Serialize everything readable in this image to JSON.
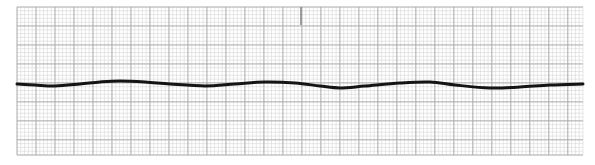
{
  "strip": {
    "paper_color": "#ffffff",
    "minor_grid_color": "#d6d6d6",
    "major_grid_color": "#a8a8a8",
    "trace_color": "#141414",
    "grid": {
      "x": 17,
      "y": 7,
      "width": 566,
      "height": 148,
      "minor": 3.79,
      "major": 18.95
    },
    "marker": {
      "x": 301,
      "y1": 7,
      "y2": 25,
      "color": "#8a8a8a"
    },
    "trace_points": [
      [
        17,
        84
      ],
      [
        35,
        85
      ],
      [
        55,
        86
      ],
      [
        80,
        84
      ],
      [
        100,
        82
      ],
      [
        120,
        81
      ],
      [
        145,
        82
      ],
      [
        170,
        84
      ],
      [
        205,
        86
      ],
      [
        235,
        84
      ],
      [
        265,
        82
      ],
      [
        295,
        83
      ],
      [
        320,
        86
      ],
      [
        340,
        88
      ],
      [
        365,
        86
      ],
      [
        400,
        83
      ],
      [
        430,
        82
      ],
      [
        455,
        85
      ],
      [
        490,
        88
      ],
      [
        520,
        87
      ],
      [
        550,
        85
      ],
      [
        583,
        84
      ]
    ]
  }
}
